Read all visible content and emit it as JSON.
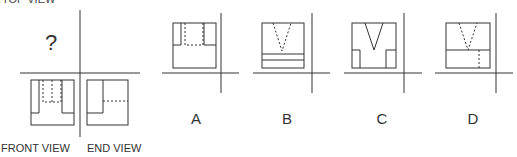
{
  "question": {
    "top_view_label": "TOP VIEW",
    "unknown_symbol": "?",
    "front_view_label": "FRONT VIEW",
    "end_view_label": "END VIEW"
  },
  "options": [
    {
      "letter": "A",
      "description": "box with two side slots and dotted inner rectangle"
    },
    {
      "letter": "B",
      "description": "box with dotted V and two bottom horizontal bands"
    },
    {
      "letter": "C",
      "description": "box with solid V and two bottom corner notches"
    },
    {
      "letter": "D",
      "description": "box with dotted V, horizontal divider and dotted vertical line"
    }
  ],
  "colors": {
    "line": "#333333",
    "background": "#ffffff"
  }
}
